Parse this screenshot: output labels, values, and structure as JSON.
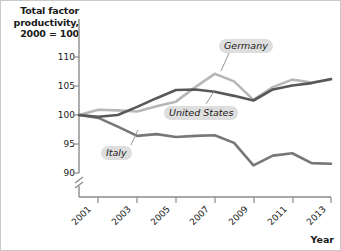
{
  "chart_data": {
    "type": "line",
    "title": "",
    "ylabel": "Total factor\nproductivity,\n2000 = 100",
    "ylabel_lines": [
      "Total factor",
      "productivity,",
      "2000 = 100"
    ],
    "xlabel": "Year",
    "ylim": [
      88.5,
      112
    ],
    "xlim": [
      2000,
      2013
    ],
    "yticks": [
      90,
      95,
      100,
      105,
      110
    ],
    "xticks": [
      2001,
      2003,
      2005,
      2007,
      2009,
      2011,
      2013
    ],
    "xtick_labels": [
      "2001",
      "2003",
      "2005",
      "2007",
      "2009",
      "2011",
      "2013"
    ],
    "ytick_labels": [
      "90",
      "95",
      "100",
      "105",
      "110"
    ],
    "grid": false,
    "legend_position": "inline-annotations",
    "axis_break": true,
    "x": [
      2000,
      2001,
      2002,
      2003,
      2004,
      2005,
      2006,
      2007,
      2008,
      2009,
      2010,
      2011,
      2012,
      2013
    ],
    "series": [
      {
        "name": "Germany",
        "color": "#b7b7b7",
        "values": [
          100.0,
          100.9,
          100.8,
          100.6,
          101.5,
          102.3,
          104.8,
          107.1,
          105.8,
          102.6,
          104.8,
          106.1,
          105.6,
          106.1
        ]
      },
      {
        "name": "United States",
        "color": "#58585a",
        "values": [
          100.0,
          99.7,
          100.0,
          101.4,
          102.9,
          104.3,
          104.4,
          104.0,
          103.3,
          102.5,
          104.4,
          105.1,
          105.5,
          106.2
        ]
      },
      {
        "name": "Italy",
        "color": "#77777a",
        "values": [
          100.0,
          99.5,
          98.0,
          96.4,
          96.7,
          96.2,
          96.4,
          96.5,
          95.2,
          91.3,
          93.0,
          93.4,
          91.7,
          91.6
        ]
      }
    ],
    "annotations": [
      {
        "text": "Germany",
        "target_series": "Germany",
        "target_x": 2008
      },
      {
        "text": "United States",
        "target_series": "United States",
        "target_x": 2007
      },
      {
        "text": "Italy",
        "target_series": "Italy",
        "target_x": 2003
      }
    ]
  },
  "colors": {
    "germany": "#b7b7b7",
    "united_states": "#58585a",
    "italy": "#77777a",
    "axis": "#8a8a8a",
    "label_pill": "#dedede",
    "text": "#1a1a1a",
    "frame": "#c9c9c9"
  }
}
